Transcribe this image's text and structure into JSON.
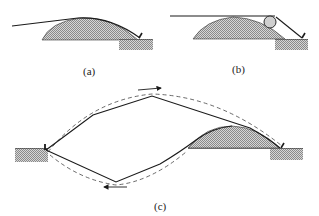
{
  "figure": {
    "panels": [
      {
        "id": "a",
        "label": "(a)",
        "description": "Cable draped over a mound, anchored to hatched ground block on the right"
      },
      {
        "id": "b",
        "label": "(b)",
        "description": "Horizontal cable over mound passing a roller then down to anchor on hatched ground block"
      },
      {
        "id": "c",
        "label": "(c)",
        "description": "Closed cable loop between two anchored ground blocks over a mound, dashed path with direction arrows"
      }
    ],
    "colors": {
      "line": "#1a1a1a",
      "hatch_fill": "#bdbdbd",
      "background": "#ffffff",
      "dashed": "#444444"
    },
    "arrows": {
      "top_direction": "right",
      "bottom_direction": "left"
    }
  }
}
